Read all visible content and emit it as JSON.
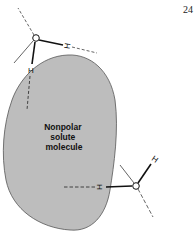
{
  "page_number": "24",
  "solute": {
    "label_lines": [
      "Nonpolar",
      "solute",
      "molecule"
    ],
    "fill_color": "#bdbdbd",
    "stroke_color": "#555555"
  },
  "water_molecules": [
    {
      "position": "top-left",
      "oxygen_symbol": "O",
      "hydrogen_labels": [
        "H",
        "H"
      ]
    },
    {
      "position": "bottom-right",
      "oxygen_symbol": "O",
      "hydrogen_labels": [
        "H",
        "H"
      ]
    }
  ]
}
